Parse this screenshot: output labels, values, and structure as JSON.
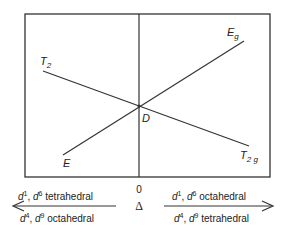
{
  "diagram": {
    "type": "Orgel diagram",
    "lines": {
      "T2": {
        "label": "T",
        "sub": "2"
      },
      "Eg": {
        "label": "E",
        "sub": "g"
      },
      "E": {
        "label": "E"
      },
      "T2g": {
        "label": "T",
        "sub": "2 g"
      }
    },
    "crossing_label": "D",
    "zero_label": "0",
    "axis_symbol": "Δ",
    "left_arrow": {
      "top": {
        "d1": "d",
        "s1": "1",
        "sep": ", ",
        "d2": "d",
        "s2": "6",
        "text": " tetrahedral"
      },
      "bottom": {
        "d1": "d",
        "s1": "4",
        "sep": ", ",
        "d2": "d",
        "s2": "9",
        "text": " octahedral"
      }
    },
    "right_arrow": {
      "top": {
        "d1": "d",
        "s1": "1",
        "sep": ", ",
        "d2": "d",
        "s2": "6",
        "text": " octahedral"
      },
      "bottom": {
        "d1": "d",
        "s1": "4",
        "sep": ", ",
        "d2": "d",
        "s2": "9",
        "text": " tetrahedral"
      }
    },
    "colors": {
      "line": "#333333",
      "text": "#222222"
    }
  }
}
